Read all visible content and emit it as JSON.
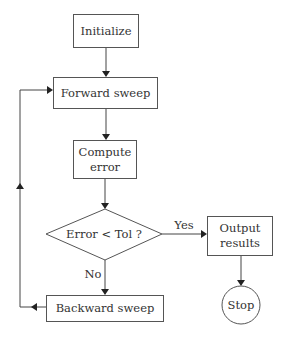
{
  "diagram": {
    "type": "flowchart",
    "nodes": {
      "initialize": {
        "label": "Initialize"
      },
      "forward_sweep": {
        "label": "Forward sweep"
      },
      "compute_error": {
        "line1": "Compute",
        "line2": "error"
      },
      "decision": {
        "label": "Error < Tol ?"
      },
      "output_results": {
        "line1": "Output",
        "line2": "results"
      },
      "backward_sweep": {
        "label": "Backward sweep"
      },
      "stop": {
        "label": "Stop"
      }
    },
    "edges": {
      "yes_label": "Yes",
      "no_label": "No"
    },
    "colors": {
      "stroke": "#555555",
      "text": "#333333",
      "background": "#ffffff"
    }
  }
}
